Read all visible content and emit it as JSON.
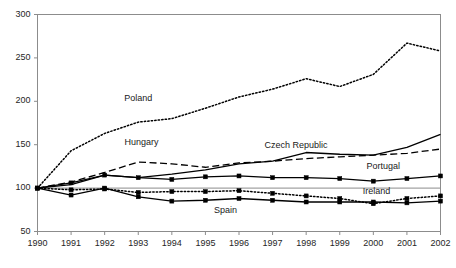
{
  "chart_data": {
    "type": "line",
    "title": "",
    "subtitle": "",
    "xlabel": "",
    "ylabel": "",
    "x": [
      1990,
      1991,
      1992,
      1993,
      1994,
      1995,
      1996,
      1997,
      1998,
      1999,
      2000,
      2001,
      2002
    ],
    "categories": [
      "1990",
      "1991",
      "1992",
      "1993",
      "1994",
      "1995",
      "1996",
      "1997",
      "1998",
      "1999",
      "2000",
      "2001",
      "2002"
    ],
    "xlim": [
      1990,
      2002
    ],
    "ylim": [
      50,
      300
    ],
    "yticks": [
      50,
      100,
      150,
      200,
      250,
      300
    ],
    "ytick_labels": [
      "50",
      "100",
      "150",
      "200",
      "250",
      "300"
    ],
    "grid": "reference line at 100 only",
    "reference_line": 100,
    "legend_position": "inline data labels",
    "series": [
      {
        "name": "Poland",
        "style": "dotted",
        "marker": "none",
        "color": "#000000",
        "label_x": 1993.0,
        "label_y": 203,
        "values": [
          100,
          143,
          163,
          176,
          180,
          192,
          205,
          214,
          226,
          217,
          231,
          267,
          258
        ]
      },
      {
        "name": "Hungary",
        "style": "dashed",
        "marker": "none",
        "color": "#000000",
        "label_x": 1993.1,
        "label_y": 152,
        "values": [
          100,
          107,
          118,
          130,
          128,
          124,
          129,
          131,
          134,
          136,
          138,
          140,
          145
        ]
      },
      {
        "name": "Czech Republic",
        "style": "solid",
        "marker": "none",
        "color": "#000000",
        "label_x": 1997.7,
        "label_y": 149,
        "values": [
          100,
          104,
          115,
          112,
          116,
          121,
          128,
          131,
          141,
          139,
          138,
          147,
          162
        ]
      },
      {
        "name": "Portugal",
        "style": "solid",
        "marker": "square",
        "color": "#000000",
        "label_x": 2000.3,
        "label_y": 124,
        "values": [
          100,
          106,
          115,
          112,
          110,
          113,
          114,
          112,
          112,
          111,
          108,
          111,
          114
        ]
      },
      {
        "name": "Ireland",
        "style": "dotted",
        "marker": "square",
        "color": "#000000",
        "label_x": 2000.1,
        "label_y": 96,
        "values": [
          100,
          98,
          99,
          95,
          96,
          96,
          97,
          94,
          91,
          88,
          82,
          88,
          91
        ]
      },
      {
        "name": "Spain",
        "style": "solid",
        "marker": "square",
        "color": "#000000",
        "label_x": 1995.6,
        "label_y": 74,
        "values": [
          100,
          92,
          100,
          90,
          85,
          86,
          88,
          86,
          84,
          84,
          84,
          83,
          85
        ]
      }
    ]
  },
  "axes": {
    "frame_color": "#8c8c8c",
    "reference_line_color": "#8c8c8c",
    "tick_color": "#8c8c8c"
  }
}
